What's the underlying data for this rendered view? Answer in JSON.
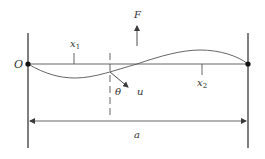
{
  "diagram": {
    "type": "beam-deflection-schematic",
    "labels": {
      "origin": "O",
      "force": "F",
      "x1": "x",
      "x1_sub": "1",
      "x2": "x",
      "x2_sub": "2",
      "theta": "θ",
      "u": "u",
      "length": "a"
    },
    "colors": {
      "stroke": "#3a3a3a",
      "text": "#333333",
      "background": "#ffffff"
    },
    "elements": [
      {
        "name": "left-support",
        "kind": "vertical-line"
      },
      {
        "name": "right-support",
        "kind": "vertical-line"
      },
      {
        "name": "beam-axis",
        "kind": "horizontal-line"
      },
      {
        "name": "deflection-curve",
        "kind": "curve"
      },
      {
        "name": "force-arrow",
        "kind": "arrow",
        "direction": "up"
      },
      {
        "name": "displacement-arrow",
        "kind": "arrow",
        "direction": "down-right"
      },
      {
        "name": "section-line",
        "kind": "dashed-line"
      },
      {
        "name": "length-dimension",
        "kind": "double-arrow"
      }
    ]
  }
}
